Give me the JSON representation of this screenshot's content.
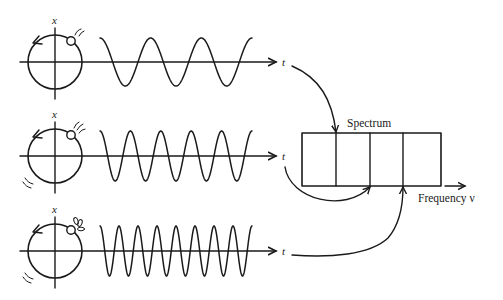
{
  "diagram": {
    "colors": {
      "ink": "#1a1a1a",
      "background": "#ffffff"
    },
    "oscillators": [
      {
        "id": "low",
        "center_y": 62,
        "axis_label": "x",
        "time_label": "t",
        "cycles": 3,
        "wave_start": 100,
        "wave_end": 252,
        "amplitude": 24,
        "target_bin_x": 336,
        "motion_marks": "small"
      },
      {
        "id": "mid",
        "center_y": 156,
        "axis_label": "x",
        "time_label": "t",
        "cycles": 5,
        "wave_start": 100,
        "wave_end": 252,
        "amplitude": 25,
        "target_bin_x": 370,
        "motion_marks": "medium"
      },
      {
        "id": "high",
        "center_y": 251,
        "axis_label": "x",
        "time_label": "t",
        "cycles": 8,
        "wave_start": 100,
        "wave_end": 252,
        "amplitude": 25,
        "target_bin_x": 403,
        "motion_marks": "large"
      }
    ],
    "spectrum": {
      "label": "Spectrum",
      "axis_label": "Frequency ν",
      "bins": 4
    }
  }
}
